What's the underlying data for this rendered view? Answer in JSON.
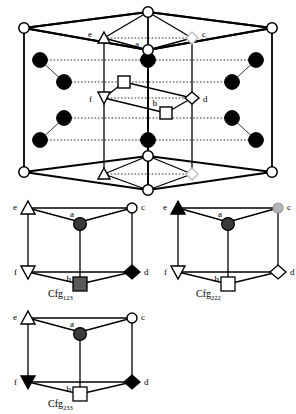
{
  "diagram": {
    "type": "crystal-structure",
    "colors": {
      "line": "#000000",
      "atom_fill": "#000000",
      "site_open": "#ffffff",
      "site_gray": "#3a3a3a",
      "site_light_gray": "#b5b5b5",
      "dotted": "#000000"
    },
    "main_cell": {
      "name": "hcp-unit-cell",
      "vertex_labels": [
        "e",
        "a",
        "c",
        "f",
        "b",
        "d"
      ],
      "labels": {
        "e": "e",
        "a": "a",
        "c": "c",
        "f": "f",
        "b": "b",
        "d": "d"
      },
      "markers": {
        "e": "open-up-triangle",
        "a": "open-circle",
        "c": "open-diamond",
        "f": "open-down-triangle",
        "b": "open-square",
        "d": "open-diamond",
        "mid": "open-square"
      },
      "corner_marker": "open-circle",
      "interior_atom_marker": "filled-circle",
      "interior_atom_count": 12,
      "corner_site_count": 12
    },
    "configs": [
      {
        "id": "cfg-123",
        "name": "Cfg",
        "subscript": "123",
        "label": "Cfg",
        "vertices": {
          "e": {
            "label": "e",
            "marker": "open-up-triangle"
          },
          "a": {
            "label": "a",
            "marker": "filled-circle"
          },
          "c": {
            "label": "c",
            "marker": "open-circle"
          },
          "f": {
            "label": "f",
            "marker": "open-down-triangle"
          },
          "b": {
            "label": "b",
            "marker": "gray-square"
          },
          "d": {
            "label": "d",
            "marker": "filled-diamond"
          }
        }
      },
      {
        "id": "cfg-222",
        "name": "Cfg",
        "subscript": "222",
        "label": "Cfg",
        "vertices": {
          "e": {
            "label": "e",
            "marker": "filled-up-triangle"
          },
          "a": {
            "label": "a",
            "marker": "filled-circle"
          },
          "c": {
            "label": "c",
            "marker": "light-gray-circle"
          },
          "f": {
            "label": "f",
            "marker": "open-down-triangle"
          },
          "b": {
            "label": "b",
            "marker": "open-square"
          },
          "d": {
            "label": "d",
            "marker": "open-diamond"
          }
        }
      },
      {
        "id": "cfg-233",
        "name": "Cfg",
        "subscript": "233",
        "label": "Cfg",
        "vertices": {
          "e": {
            "label": "e",
            "marker": "open-up-triangle"
          },
          "a": {
            "label": "a",
            "marker": "filled-circle"
          },
          "c": {
            "label": "c",
            "marker": "open-circle"
          },
          "f": {
            "label": "f",
            "marker": "filled-down-triangle"
          },
          "b": {
            "label": "b",
            "marker": "open-square"
          },
          "d": {
            "label": "d",
            "marker": "filled-diamond"
          }
        }
      }
    ]
  }
}
